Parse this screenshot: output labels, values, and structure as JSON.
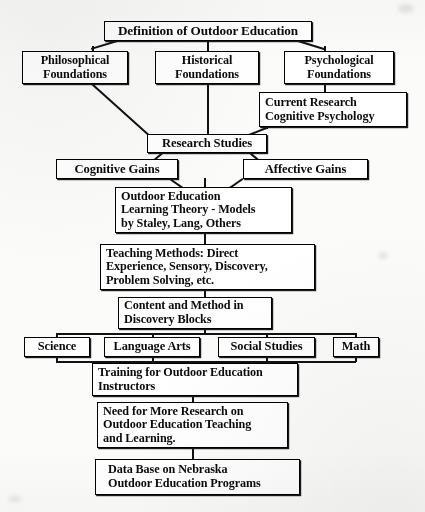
{
  "diagram": {
    "type": "flowchart",
    "ink_color": "#000000",
    "paper_color": "#fcfbf8",
    "nodes": [
      {
        "id": "definition",
        "lines": [
          "Definition of Outdoor Education"
        ]
      },
      {
        "id": "philosophical",
        "lines": [
          "Philosophical",
          "Foundations"
        ]
      },
      {
        "id": "historical",
        "lines": [
          "Historical",
          "Foundations"
        ]
      },
      {
        "id": "psychological",
        "lines": [
          "Psychological",
          "Foundations"
        ]
      },
      {
        "id": "current-research",
        "lines": [
          "Current Research",
          "Cognitive Psychology"
        ]
      },
      {
        "id": "research-studies",
        "lines": [
          "Research Studies"
        ]
      },
      {
        "id": "cognitive-gains",
        "lines": [
          "Cognitive Gains"
        ]
      },
      {
        "id": "affective-gains",
        "lines": [
          "Affective Gains"
        ]
      },
      {
        "id": "learning-theory",
        "lines": [
          "Outdoor Education",
          "Learning Theory - Models",
          "by Staley, Lang, Others"
        ]
      },
      {
        "id": "teaching-methods",
        "lines": [
          "Teaching Methods:  Direct",
          "Experience, Sensory, Discovery,",
          "Problem Solving, etc."
        ]
      },
      {
        "id": "content-method",
        "lines": [
          "Content and Method in",
          "Discovery Blocks"
        ]
      },
      {
        "id": "science",
        "lines": [
          "Science"
        ]
      },
      {
        "id": "language-arts",
        "lines": [
          "Language Arts"
        ]
      },
      {
        "id": "social-studies",
        "lines": [
          "Social Studies"
        ]
      },
      {
        "id": "math",
        "lines": [
          "Math"
        ]
      },
      {
        "id": "training",
        "lines": [
          "Training for Outdoor Education",
          "Instructors"
        ]
      },
      {
        "id": "need-research",
        "lines": [
          "Need for More Research on",
          "Outdoor Education Teaching",
          "and Learning."
        ]
      },
      {
        "id": "data-base",
        "lines": [
          "Data Base on Nebraska",
          "Outdoor Education Programs"
        ]
      }
    ]
  },
  "nodes": {
    "definition": {
      "l1": "Definition of Outdoor Education"
    },
    "philosophical": {
      "l1": "Philosophical",
      "l2": "Foundations"
    },
    "historical": {
      "l1": "Historical",
      "l2": "Foundations"
    },
    "psychological": {
      "l1": "Psychological",
      "l2": "Foundations"
    },
    "current_research": {
      "l1": "Current Research",
      "l2": "Cognitive Psychology"
    },
    "research_studies": {
      "l1": "Research Studies"
    },
    "cognitive_gains": {
      "l1": "Cognitive Gains"
    },
    "affective_gains": {
      "l1": "Affective Gains"
    },
    "learning_theory": {
      "l1": "Outdoor Education",
      "l2": "Learning Theory - Models",
      "l3": "by Staley, Lang, Others"
    },
    "teaching_methods": {
      "l1": "Teaching Methods:  Direct",
      "l2": "Experience, Sensory, Discovery,",
      "l3": "Problem Solving, etc."
    },
    "content_method": {
      "l1": "Content and Method in",
      "l2": "Discovery Blocks"
    },
    "science": {
      "l1": "Science"
    },
    "language_arts": {
      "l1": "Language Arts"
    },
    "social_studies": {
      "l1": "Social Studies"
    },
    "math": {
      "l1": "Math"
    },
    "training": {
      "l1": "Training for Outdoor Education",
      "l2": "Instructors"
    },
    "need_research": {
      "l1": "Need for More Research on",
      "l2": "Outdoor Education Teaching",
      "l3": "and Learning."
    },
    "data_base": {
      "l1": "Data Base on Nebraska",
      "l2": "Outdoor Education Programs"
    }
  }
}
